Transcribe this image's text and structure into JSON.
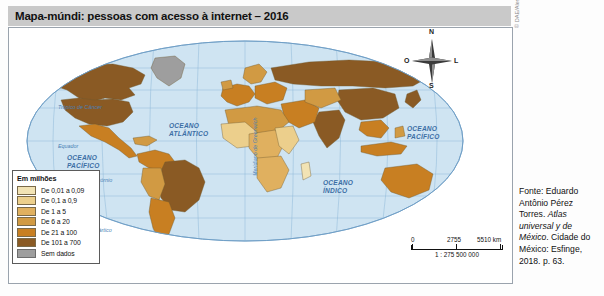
{
  "title": "Mapa-múndi: pessoas com acesso à internet – 2016",
  "legend": {
    "title": "Em milhões",
    "items": [
      {
        "label": "De 0,01 a 0,09",
        "color": "#f2e3b4"
      },
      {
        "label": "De 0,1 a 0,9",
        "color": "#eccf8c"
      },
      {
        "label": "De 1 a 5",
        "color": "#e0b05f"
      },
      {
        "label": "De 6 a 20",
        "color": "#d19a43"
      },
      {
        "label": "De 21 a 100",
        "color": "#c87f22"
      },
      {
        "label": "De 101 a 700",
        "color": "#8a5a24"
      },
      {
        "label": "Sem dados",
        "color": "#9e9e9e"
      }
    ]
  },
  "compass": {
    "north": "N",
    "south": "S",
    "west": "O",
    "east": "L"
  },
  "scale": {
    "min": "0",
    "mid": "2755",
    "max": "5510 km",
    "ratio": "1 : 275 500 000"
  },
  "map_labels": {
    "oceans": [
      {
        "name": "oceano-pacifico-oeste",
        "line1": "OCEANO",
        "line2": "PACÍFICO",
        "x": 66,
        "y": 128
      },
      {
        "name": "oceano-atlantico",
        "line1": "OCEANO",
        "line2": "ATLÂNTICO",
        "x": 168,
        "y": 96
      },
      {
        "name": "oceano-indico",
        "line1": "OCEANO",
        "line2": "ÍNDICO",
        "x": 322,
        "y": 153
      },
      {
        "name": "oceano-pacifico-leste",
        "line1": "OCEANO",
        "line2": "PACÍFICO",
        "x": 406,
        "y": 99
      }
    ],
    "latitudes": [
      {
        "name": "tropico-de-cancer",
        "text": "Trópico de Câncer",
        "x": 57,
        "y": 104
      },
      {
        "name": "equador",
        "text": "Equador",
        "x": 57,
        "y": 143
      },
      {
        "name": "tropico-de-capricornio",
        "text": "Trópico de Capricórnio",
        "x": 57,
        "y": 177
      },
      {
        "name": "circulo-polar-antartico",
        "text": "Círculo Polar Antártico",
        "x": 57,
        "y": 228
      }
    ],
    "meridian": "Meridiano de Greenwich"
  },
  "credit": "© DAE/Alessandro Passos da Costa",
  "source": {
    "line1": "Fonte: Eduardo",
    "line2": "Antônio Pérez Torres.",
    "italic1": "Atlas universal y",
    "italic2": "de México",
    "line3": ". Cidade",
    "line4": "do México: Esfinge,",
    "line5": "2018. p. 63."
  },
  "colors": {
    "ocean": "#cfe4f2",
    "graticule": "#8fb8d8",
    "title_bar": "#c9c9c9",
    "frame": "#9aa3ad"
  }
}
